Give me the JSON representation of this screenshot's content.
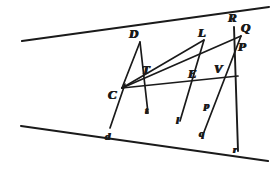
{
  "figure": {
    "width": 280,
    "height": 173,
    "background_color": "#ffffff",
    "ink_color": "#1a1a1a"
  },
  "labels": [
    {
      "id": "D",
      "text": "D",
      "x": 129,
      "y": 27,
      "size": "upper"
    },
    {
      "id": "L",
      "text": "L",
      "x": 198,
      "y": 26,
      "size": "upper"
    },
    {
      "id": "R",
      "text": "R",
      "x": 228,
      "y": 11,
      "size": "upper"
    },
    {
      "id": "Q",
      "text": "Q",
      "x": 241,
      "y": 21,
      "size": "upper"
    },
    {
      "id": "P",
      "text": "P",
      "x": 238,
      "y": 40,
      "size": "upper"
    },
    {
      "id": "T",
      "text": "T",
      "x": 142,
      "y": 63,
      "size": "upper"
    },
    {
      "id": "E",
      "text": "E",
      "x": 188,
      "y": 67,
      "size": "upper"
    },
    {
      "id": "V",
      "text": "V",
      "x": 214,
      "y": 62,
      "size": "upper"
    },
    {
      "id": "C",
      "text": "C",
      "x": 108,
      "y": 88,
      "size": "upper"
    },
    {
      "id": "p",
      "text": "p",
      "x": 204,
      "y": 100,
      "size": "lower"
    },
    {
      "id": "t",
      "text": "t",
      "x": 145,
      "y": 105,
      "size": "lower"
    },
    {
      "id": "l",
      "text": "l",
      "x": 176,
      "y": 115,
      "size": "lower"
    },
    {
      "id": "q",
      "text": "q",
      "x": 199,
      "y": 128,
      "size": "lower"
    },
    {
      "id": "d",
      "text": "d",
      "x": 105,
      "y": 131,
      "size": "lower"
    },
    {
      "id": "r",
      "text": "r",
      "x": 233,
      "y": 144,
      "size": "lower"
    }
  ],
  "points": {
    "C": {
      "x": 122,
      "y": 88
    },
    "D": {
      "x": 140,
      "y": 42
    },
    "T": {
      "x": 143,
      "y": 75
    },
    "t": {
      "x": 147,
      "y": 113
    },
    "d": {
      "x": 110,
      "y": 130
    },
    "L": {
      "x": 203,
      "y": 40
    },
    "E": {
      "x": 196,
      "y": 80
    },
    "l": {
      "x": 180,
      "y": 121
    },
    "Q": {
      "x": 240,
      "y": 33
    },
    "P": {
      "x": 236,
      "y": 52
    },
    "p": {
      "x": 211,
      "y": 108
    },
    "q": {
      "x": 204,
      "y": 132
    },
    "R": {
      "x": 234,
      "y": 27
    },
    "V": {
      "x": 222,
      "y": 78
    },
    "r": {
      "x": 238,
      "y": 150
    }
  },
  "strokes": [
    {
      "name": "upper-oblique-line",
      "kind": "line",
      "from": {
        "x": 22,
        "y": 41
      },
      "to": {
        "x": 269,
        "y": 7
      },
      "width": 2.1,
      "note": "Long straight line descending from upper-left through C and rising to R/Q at upper-right"
    },
    {
      "name": "lower-oblique-line",
      "kind": "line",
      "from": {
        "x": 21,
        "y": 126
      },
      "to": {
        "x": 268,
        "y": 161
      },
      "width": 2.1,
      "note": "Long straight line from lower-left through C continuing down-right past t, l, q, r"
    },
    {
      "name": "ray-C-to-V",
      "kind": "line",
      "from": {
        "x": 122,
        "y": 88
      },
      "to": {
        "x": 238,
        "y": 76
      },
      "width": 1.7,
      "note": "Near-horizontal ray C-E-V"
    },
    {
      "name": "ray-C-to-D",
      "kind": "line",
      "from": {
        "x": 122,
        "y": 88
      },
      "to": {
        "x": 140,
        "y": 42
      },
      "width": 1.7
    },
    {
      "name": "ray-C-to-Q",
      "kind": "line",
      "from": {
        "x": 122,
        "y": 88
      },
      "to": {
        "x": 241,
        "y": 36
      },
      "width": 1.7
    },
    {
      "name": "ray-C-to-d",
      "kind": "line",
      "from": {
        "x": 125,
        "y": 84
      },
      "to": {
        "x": 110,
        "y": 128
      },
      "width": 1.7
    },
    {
      "name": "chord-D-to-t",
      "kind": "line",
      "from": {
        "x": 140,
        "y": 42
      },
      "to": {
        "x": 148,
        "y": 113
      },
      "width": 1.7
    },
    {
      "name": "chord-L-to-l",
      "kind": "line",
      "from": {
        "x": 204,
        "y": 40
      },
      "to": {
        "x": 180,
        "y": 121
      },
      "width": 1.7
    },
    {
      "name": "chord-Q-to-q",
      "kind": "line",
      "from": {
        "x": 241,
        "y": 36
      },
      "to": {
        "x": 204,
        "y": 132
      },
      "width": 1.7
    },
    {
      "name": "chord-R-to-r",
      "kind": "line",
      "from": {
        "x": 234,
        "y": 27
      },
      "to": {
        "x": 238,
        "y": 151
      },
      "width": 1.9
    },
    {
      "name": "chord-C-to-L",
      "kind": "line",
      "from": {
        "x": 122,
        "y": 88
      },
      "to": {
        "x": 204,
        "y": 40
      },
      "width": 1.6
    }
  ]
}
